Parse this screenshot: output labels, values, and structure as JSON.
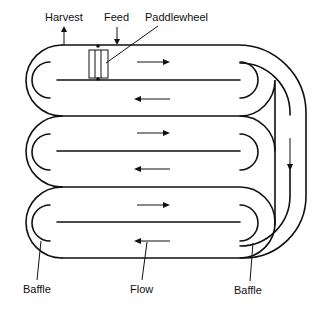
{
  "diagram": {
    "type": "raceway-pond",
    "labels": {
      "harvest": "Harvest",
      "feed": "Feed",
      "paddlewheel": "Paddlewheel",
      "baffle_left": "Baffle",
      "flow": "Flow",
      "baffle_right": "Baffle"
    },
    "channels": [
      {
        "id": "channel-1",
        "flow_direction": "right"
      },
      {
        "id": "channel-2",
        "flow_direction": "left"
      },
      {
        "id": "channel-3",
        "flow_direction": "right"
      },
      {
        "id": "channel-4",
        "flow_direction": "left"
      },
      {
        "id": "channel-5",
        "flow_direction": "right"
      },
      {
        "id": "channel-6",
        "flow_direction": "left"
      },
      {
        "id": "return-channel",
        "flow_direction": "down"
      }
    ],
    "colors": {
      "line": "#111111",
      "background": "#ffffff"
    }
  }
}
